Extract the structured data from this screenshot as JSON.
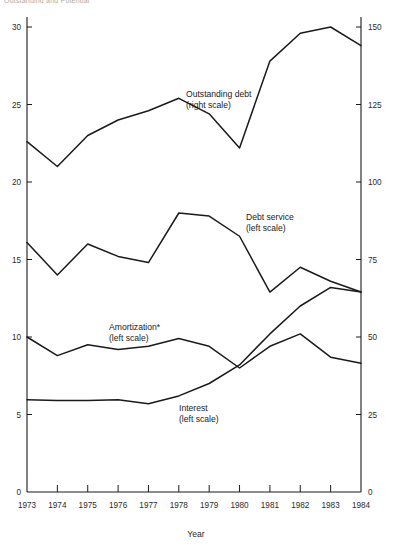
{
  "figure": {
    "clipped_header": "Outstanding and Potential",
    "xlabel": "Year",
    "origin_label_left": "0",
    "origin_label_right": "0"
  },
  "chart_data": {
    "type": "line",
    "title": "",
    "xlabel": "Year",
    "ylabel": "",
    "grid": false,
    "legend": "inline-annotations",
    "x": [
      1973,
      1974,
      1975,
      1976,
      1977,
      1978,
      1979,
      1980,
      1981,
      1982,
      1983,
      1984
    ],
    "xtick_labels": [
      "1973",
      "1974",
      "1975",
      "1976",
      "1977",
      "1978",
      "1979",
      "1980",
      "1981",
      "1982",
      "1983",
      "1984"
    ],
    "left_axis": {
      "ticks": [
        0,
        5,
        10,
        15,
        20,
        25,
        30
      ],
      "tick_labels": [
        "0",
        "5",
        "10",
        "15",
        "20",
        "25",
        "30"
      ],
      "ylim": [
        0,
        30
      ]
    },
    "right_axis": {
      "ticks": [
        0,
        25,
        50,
        75,
        100,
        125,
        150
      ],
      "tick_labels": [
        "0",
        "25",
        "50",
        "75",
        "100",
        "125",
        "150"
      ],
      "ylim": [
        0,
        150
      ]
    },
    "series": [
      {
        "name": "Outstanding debt",
        "scale": "right",
        "label_line1": "Outstanding debt",
        "label_line2": "(right scale)",
        "values": [
          113,
          105,
          115,
          120,
          123,
          127,
          122,
          111,
          139,
          148,
          150,
          144
        ]
      },
      {
        "name": "Debt service",
        "scale": "left",
        "label_line1": "Debt service",
        "label_line2": "(left scale)",
        "values": [
          16.1,
          14.0,
          16.0,
          15.2,
          14.8,
          18.0,
          17.8,
          16.5,
          12.9,
          14.5,
          13.6,
          12.9
        ]
      },
      {
        "name": "Amortization*",
        "scale": "left",
        "label_line1": "Amortization*",
        "label_line2": "(left scale)",
        "values": [
          10.0,
          8.8,
          9.5,
          9.2,
          9.4,
          9.9,
          9.4,
          8.0,
          9.4,
          10.2,
          8.7,
          8.3
        ]
      },
      {
        "name": "Interest",
        "scale": "left",
        "label_line1": "Interest",
        "label_line2": "(left scale)",
        "values": [
          5.95,
          5.9,
          5.9,
          5.95,
          5.7,
          6.2,
          7.0,
          8.2,
          10.2,
          12.0,
          13.2,
          12.9
        ]
      }
    ]
  },
  "annotations": [
    {
      "text": "Outstanding debt",
      "sub": "(right scale)"
    },
    {
      "text": "Debt service",
      "sub": "(left scale)"
    },
    {
      "text": "Amortization*",
      "sub": "(left scale)"
    },
    {
      "text": "Interest",
      "sub": "(left scale)"
    }
  ]
}
